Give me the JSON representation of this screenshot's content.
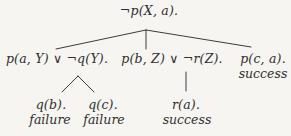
{
  "diagram": {
    "root": {
      "label": "¬p(X, a)."
    },
    "level2": [
      {
        "label": "p(a, Y) ∨ ¬q(Y)."
      },
      {
        "label": "p(b, Z) ∨ ¬r(Z)."
      },
      {
        "label": "p(c, a).",
        "status": "success"
      }
    ],
    "level3": [
      {
        "label": "q(b).",
        "status": "failure"
      },
      {
        "label": "q(c).",
        "status": "failure"
      },
      {
        "label": "r(a).",
        "status": "success"
      }
    ],
    "colors": {
      "background": "#f6f5f1",
      "text": "#2f2f2f",
      "line": "#3c3c3c"
    }
  }
}
